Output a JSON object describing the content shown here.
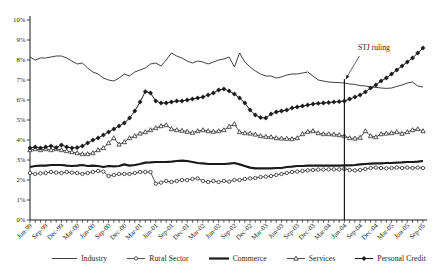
{
  "figure": {
    "background": "#ffffff",
    "ink_color": "#1d1d1d"
  },
  "annotation": {
    "label": "STJ ruling",
    "at_x_label": "Jun-04",
    "month_index": 60,
    "line_top_percent": 7.05
  },
  "chart_data": {
    "type": "line",
    "title": "",
    "xlabel": "",
    "ylabel": "",
    "ylim": [
      0,
      10
    ],
    "ytick_labels": [
      "0%",
      "1%",
      "2%",
      "3%",
      "4%",
      "5%",
      "6%",
      "7%",
      "8%",
      "9%",
      "10%"
    ],
    "x_unit": "month",
    "n_points": 76,
    "first_month": "Jun-99",
    "last_month": "Sep-05",
    "x_tick_label_every_months": 3,
    "x_tick_labels": [
      "Jun-99",
      "Sep-99",
      "Dec-99",
      "Mar-00",
      "Jun-00",
      "Sep-00",
      "Dec-00",
      "Mar-01",
      "Jun-01",
      "Sep-01",
      "Dec-01",
      "Mar-02",
      "Jun-02",
      "Sep-02",
      "Dec-02",
      "Mar-03",
      "Jun-03",
      "Sep-03",
      "Dec-03",
      "Mar-04",
      "Jun-04",
      "Sep-04",
      "Dec-04",
      "Mar-05",
      "Jun-05",
      "Sep-05"
    ],
    "legend_position": "bottom",
    "grid": false,
    "series": [
      {
        "name": "Industry",
        "marker": "none",
        "line_width": 0.9,
        "color": "#2a2a2a",
        "values": [
          8.15,
          8.0,
          8.1,
          8.1,
          8.15,
          8.2,
          8.2,
          8.1,
          7.95,
          7.8,
          7.85,
          7.6,
          7.4,
          7.3,
          7.1,
          7.0,
          6.95,
          7.1,
          7.3,
          7.2,
          7.4,
          7.5,
          7.6,
          7.8,
          7.85,
          7.7,
          8.0,
          8.35,
          8.2,
          8.1,
          7.95,
          7.85,
          7.95,
          7.9,
          7.8,
          7.9,
          8.0,
          8.05,
          8.15,
          7.65,
          8.35,
          7.9,
          7.65,
          7.45,
          7.3,
          7.2,
          7.2,
          7.1,
          7.15,
          7.25,
          7.3,
          7.3,
          7.35,
          7.4,
          7.2,
          7.0,
          6.95,
          6.9,
          6.88,
          6.87,
          6.85,
          6.8,
          6.78,
          6.72,
          6.7,
          6.65,
          6.63,
          6.6,
          6.58,
          6.6,
          6.68,
          6.75,
          6.85,
          6.9,
          6.7,
          6.65
        ]
      },
      {
        "name": "Rural Sector",
        "marker": "circle",
        "line_width": 0.8,
        "color": "#2a2a2a",
        "values": [
          2.35,
          2.3,
          2.33,
          2.35,
          2.4,
          2.37,
          2.35,
          2.4,
          2.37,
          2.35,
          2.3,
          2.35,
          2.4,
          2.45,
          2.42,
          2.2,
          2.25,
          2.3,
          2.3,
          2.3,
          2.35,
          2.4,
          2.4,
          2.4,
          1.82,
          1.87,
          1.95,
          1.9,
          1.95,
          2.0,
          2.0,
          2.05,
          2.08,
          1.95,
          1.9,
          1.95,
          1.9,
          1.95,
          1.92,
          2.0,
          2.0,
          2.05,
          2.08,
          2.1,
          2.15,
          2.17,
          2.2,
          2.25,
          2.3,
          2.35,
          2.4,
          2.42,
          2.45,
          2.48,
          2.5,
          2.52,
          2.52,
          2.53,
          2.53,
          2.53,
          2.55,
          2.5,
          2.48,
          2.5,
          2.55,
          2.6,
          2.62,
          2.6,
          2.58,
          2.6,
          2.62,
          2.6,
          2.62,
          2.6,
          2.62,
          2.6
        ]
      },
      {
        "name": "Commerce",
        "marker": "none",
        "line_width": 2.2,
        "color": "#1a1a1a",
        "values": [
          2.65,
          2.7,
          2.72,
          2.72,
          2.75,
          2.75,
          2.75,
          2.72,
          2.7,
          2.72,
          2.75,
          2.7,
          2.72,
          2.7,
          2.65,
          2.7,
          2.68,
          2.7,
          2.78,
          2.72,
          2.75,
          2.8,
          2.87,
          2.88,
          2.9,
          2.9,
          2.9,
          2.92,
          2.95,
          2.97,
          2.95,
          2.9,
          2.85,
          2.83,
          2.8,
          2.8,
          2.8,
          2.8,
          2.82,
          2.85,
          2.78,
          2.7,
          2.62,
          2.58,
          2.58,
          2.58,
          2.58,
          2.6,
          2.6,
          2.65,
          2.67,
          2.7,
          2.7,
          2.72,
          2.72,
          2.72,
          2.72,
          2.72,
          2.72,
          2.72,
          2.73,
          2.73,
          2.75,
          2.78,
          2.8,
          2.82,
          2.83,
          2.83,
          2.85,
          2.85,
          2.87,
          2.88,
          2.9,
          2.9,
          2.92,
          2.95
        ]
      },
      {
        "name": "Services",
        "marker": "triangle",
        "line_width": 0.8,
        "color": "#2a2a2a",
        "values": [
          3.5,
          3.55,
          3.5,
          3.55,
          3.5,
          3.55,
          3.5,
          3.45,
          3.4,
          3.35,
          3.3,
          3.3,
          3.35,
          3.5,
          3.6,
          3.85,
          4.1,
          3.78,
          3.9,
          4.1,
          4.2,
          4.33,
          4.4,
          4.5,
          4.6,
          4.7,
          4.75,
          4.55,
          4.5,
          4.47,
          4.42,
          4.37,
          4.45,
          4.5,
          4.45,
          4.42,
          4.45,
          4.5,
          4.67,
          4.8,
          4.4,
          4.35,
          4.33,
          4.28,
          4.2,
          4.17,
          4.15,
          4.1,
          4.08,
          4.07,
          4.05,
          4.1,
          4.3,
          4.42,
          4.45,
          4.35,
          4.3,
          4.3,
          4.28,
          4.25,
          4.2,
          4.1,
          4.08,
          4.12,
          4.45,
          4.2,
          4.15,
          4.3,
          4.33,
          4.35,
          4.4,
          4.32,
          4.4,
          4.5,
          4.55,
          4.45
        ]
      },
      {
        "name": "Personal Credit",
        "marker": "diamond",
        "line_width": 1.0,
        "color": "#1a1a1a",
        "values": [
          3.6,
          3.65,
          3.6,
          3.65,
          3.7,
          3.62,
          3.75,
          3.65,
          3.6,
          3.62,
          3.7,
          3.85,
          4.0,
          4.1,
          4.25,
          4.4,
          4.55,
          4.7,
          4.85,
          5.1,
          5.45,
          5.9,
          6.42,
          6.35,
          5.95,
          5.85,
          5.85,
          5.9,
          5.95,
          5.95,
          6.0,
          6.05,
          6.1,
          6.15,
          6.25,
          6.35,
          6.5,
          6.55,
          6.45,
          6.3,
          6.1,
          5.85,
          5.5,
          5.25,
          5.12,
          5.1,
          5.3,
          5.4,
          5.45,
          5.5,
          5.6,
          5.65,
          5.7,
          5.75,
          5.8,
          5.83,
          5.85,
          5.87,
          5.9,
          5.92,
          5.95,
          6.05,
          6.15,
          6.25,
          6.4,
          6.6,
          6.75,
          6.95,
          7.1,
          7.3,
          7.5,
          7.7,
          7.9,
          8.1,
          8.35,
          8.6
        ]
      }
    ]
  }
}
